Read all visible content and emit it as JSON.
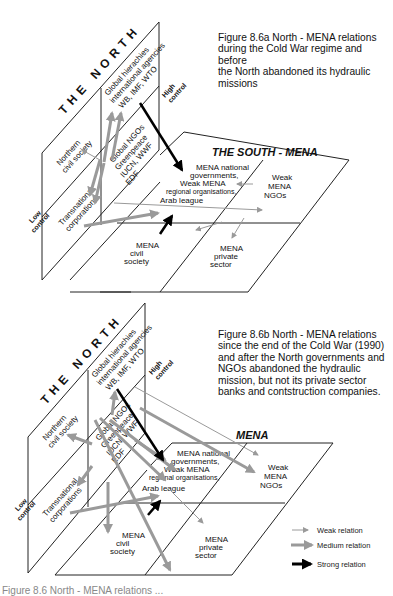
{
  "figure_a": {
    "caption": "Figure 8.6a  North - MENA relations\nduring the Cold War regime and before\nthe North abandoned its hydraulic\nmissions",
    "north_title": "THE NORTH",
    "south_title": "THE SOUTH - MENA",
    "control_high": [
      "High",
      "control"
    ],
    "control_low": [
      "Low",
      "control"
    ],
    "north_cells": {
      "global_hierarchies": [
        "Global hierachies",
        "international agencies",
        "WB, IMF, WTO"
      ],
      "northern_civil_society": [
        "Northern",
        "civil society"
      ],
      "global_ngos": [
        "Global NGOs",
        "Greenpeace",
        "IUCN, WWF",
        "EDF"
      ],
      "transnational_corporations": [
        "Transnational",
        "corporations"
      ]
    },
    "south_cells": {
      "governments": [
        "MENA national",
        "governments,",
        "Weak MENA",
        "regional organisations,",
        "Arab league"
      ],
      "ngos": [
        "Weak",
        "MENA",
        "NGOs"
      ],
      "civil_society": [
        "MENA",
        "civil",
        "society"
      ],
      "private_sector": [
        "MENA",
        "private",
        "sector"
      ]
    }
  },
  "figure_b": {
    "caption": "Figure 8.6b  North - MENA relations\nsince the end of the Cold War (1990)\nand after the North governments and\nNGOs abandoned the hydraulic\nmission, but not its private sector\nbanks and contstruction companies.",
    "north_title": "THE NORTH",
    "south_title": "MENA",
    "control_high": [
      "High",
      "control"
    ],
    "control_low": [
      "Low",
      "control"
    ],
    "north_cells": {
      "global_hierarchies": [
        "Global hierachies",
        "international agencies",
        "WB, IMF, WTO"
      ],
      "northern_civil_society": [
        "Northern",
        "civil society"
      ],
      "global_ngos": [
        "Global NGOs",
        "Greenpeace",
        "IUCN, WWF",
        "EDF"
      ],
      "transnational_corporations": [
        "Transnational",
        "corporations"
      ]
    },
    "south_cells": {
      "governments": [
        "MENA national",
        "governments,",
        "Weak MENA",
        "regional organisations,",
        "Arab league"
      ],
      "ngos": [
        "Weak",
        "MENA",
        "NGOs"
      ],
      "civil_society": [
        "MENA",
        "civil",
        "society"
      ],
      "private_sector": [
        "MENA",
        "private",
        "sector"
      ]
    }
  },
  "legend": {
    "weak": "Weak relation",
    "medium": "Medium relation",
    "strong": "Strong relation"
  },
  "colors": {
    "line": "#222222",
    "weak_arrow": "#9a9a9a",
    "medium_arrow": "#9a9a9a",
    "strong_arrow": "#000000"
  },
  "bottom_caption": "Figure 8.6  North - MENA relations ..."
}
